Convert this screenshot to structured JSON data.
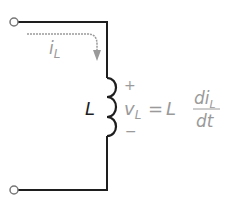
{
  "diagram": {
    "type": "inductor-circuit",
    "colors": {
      "wire": "#1e1e1e",
      "label": "#1e1e1e",
      "annotation": "#9a9a9a"
    },
    "terminals": [
      {
        "name": "top-terminal",
        "x": 14,
        "y": 22
      },
      {
        "name": "bottom-terminal",
        "x": 14,
        "y": 190
      }
    ],
    "current_label": {
      "main": "i",
      "subscript": "L"
    },
    "inductor_label": "L",
    "polarity": {
      "plus": "+",
      "minus": "−"
    },
    "equation": {
      "lhs_main": "v",
      "lhs_sub": "L",
      "equals": "=",
      "coefficient": "L",
      "numerator_main": "di",
      "numerator_sub": "L",
      "denominator": "dt"
    }
  }
}
